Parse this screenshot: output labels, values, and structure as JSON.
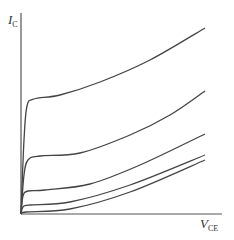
{
  "chart_data": {
    "type": "line",
    "title": "",
    "xlabel": "V_CE",
    "ylabel": "I_C",
    "axis_labels": {
      "y": {
        "main": "I",
        "sub": "C"
      },
      "x": {
        "main": "V",
        "sub": "CE"
      }
    },
    "grid": false,
    "legend": null,
    "ticks": "none",
    "series": [
      {
        "name": "curve-1",
        "points_px": [
          [
            21,
            214
          ],
          [
            24,
            140
          ],
          [
            27,
            106
          ],
          [
            34,
            99
          ],
          [
            60,
            95
          ],
          [
            100,
            82
          ],
          [
            150,
            60
          ],
          [
            205,
            28
          ]
        ]
      },
      {
        "name": "curve-2",
        "points_px": [
          [
            21,
            214
          ],
          [
            24,
            175
          ],
          [
            28,
            160
          ],
          [
            40,
            156
          ],
          [
            80,
            153
          ],
          [
            130,
            135
          ],
          [
            170,
            115
          ],
          [
            205,
            91
          ]
        ]
      },
      {
        "name": "curve-3",
        "points_px": [
          [
            21,
            214
          ],
          [
            23,
            196
          ],
          [
            28,
            191
          ],
          [
            45,
            190
          ],
          [
            90,
            184
          ],
          [
            140,
            165
          ],
          [
            205,
            134
          ]
        ]
      },
      {
        "name": "curve-4",
        "points_px": [
          [
            21,
            214
          ],
          [
            23,
            207
          ],
          [
            30,
            205
          ],
          [
            70,
            202
          ],
          [
            130,
            185
          ],
          [
            205,
            155
          ]
        ]
      },
      {
        "name": "curve-5",
        "points_px": [
          [
            21,
            214
          ],
          [
            26,
            212
          ],
          [
            70,
            209
          ],
          [
            130,
            192
          ],
          [
            205,
            160
          ]
        ]
      }
    ]
  }
}
